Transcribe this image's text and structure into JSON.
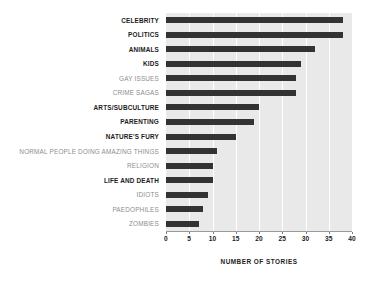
{
  "chart_data": {
    "type": "bar",
    "orientation": "horizontal",
    "title": "",
    "xlabel": "NUMBER OF STORIES",
    "ylabel": "",
    "xlim": [
      0,
      40
    ],
    "xticks": [
      0,
      5,
      10,
      15,
      20,
      25,
      30,
      35,
      40
    ],
    "xtick_labels": [
      "0",
      "5",
      "10",
      "15",
      "20",
      "25",
      "30",
      "35",
      "40"
    ],
    "grid": "vertical-only",
    "legend": "none",
    "categories": [
      "CELEBRITY",
      "POLITICS",
      "ANIMALS",
      "KIDS",
      "GAY ISSUES",
      "CRIME SAGAS",
      "ARTS/SUBCULTURE",
      "PARENTING",
      "NATURE'S FURY",
      "NORMAL PEOPLE DOING AMAZING THINGS",
      "RELIGION",
      "LIFE AND DEATH",
      "IDIOTS",
      "PAEDOPHILES",
      "ZOMBIES"
    ],
    "values": [
      38,
      38,
      32,
      29,
      28,
      28,
      20,
      19,
      15,
      11,
      10,
      10,
      9,
      8,
      7
    ],
    "label_emphasis": [
      true,
      true,
      true,
      true,
      false,
      false,
      true,
      true,
      true,
      false,
      false,
      true,
      false,
      false,
      false
    ],
    "colors": {
      "bar": "#333333",
      "plot_background": "#e9e9e9",
      "gridline": "#ffffff",
      "figure_background": "#ffffff",
      "label_emphasized": "#1c1c1c",
      "label_plain": "#8d8d8d",
      "axis": "#9a9a9a"
    }
  }
}
